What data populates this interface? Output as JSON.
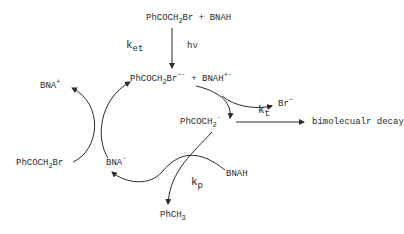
{
  "diagram": {
    "type": "reaction-scheme",
    "reactants": {
      "part1": "PhCOCH",
      "sub1": "2",
      "part2": "Br",
      "plus": "+",
      "part3": "BNAH"
    },
    "excitation": {
      "k": "k",
      "k_sub": "et",
      "light": "hν"
    },
    "radical_ion_pair": {
      "part1": "PhCOCH",
      "sub1": "2",
      "part2": "Br",
      "sup1": "−·",
      "plus": "+",
      "part3": "BNAH",
      "sup2": "+·"
    },
    "bromide": {
      "text": "Br",
      "sup": "−"
    },
    "radical": {
      "part1": "PhCOCH",
      "sub1": "2",
      "sup1": "·"
    },
    "termination": {
      "k": "k",
      "k_sub": "t",
      "product": "bimolecualr decay"
    },
    "propagation": {
      "k": "k",
      "k_sub": "p",
      "donor": "BNAH",
      "product_part1": "PhCH",
      "product_sub": "3"
    },
    "chain_cycle": {
      "bna_cation": {
        "text": "BNA",
        "sup": "+"
      },
      "substrate": {
        "part1": "PhCOCH",
        "sub1": "2",
        "part2": "Br"
      },
      "bna_radical": {
        "text": "BNA",
        "sup": "·"
      }
    }
  }
}
